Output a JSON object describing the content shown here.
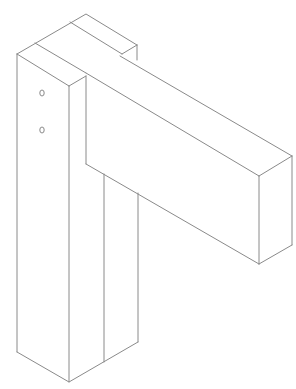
{
  "diagram": {
    "title": "Isometric post and beam joint",
    "stroke_color": "#8a8a8a",
    "background": "#ffffff",
    "parts": [
      {
        "name": "vertical-post",
        "description": "Vertical post with two holes"
      },
      {
        "name": "horizontal-beam",
        "description": "Horizontal beam projecting to the right"
      },
      {
        "name": "rear-member",
        "description": "Rear member behind post top"
      }
    ],
    "holes": [
      {
        "cx": 42,
        "cy": 93
      },
      {
        "cx": 42,
        "cy": 130
      }
    ]
  }
}
